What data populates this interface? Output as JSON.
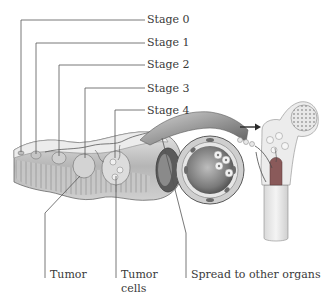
{
  "diagram": {
    "stages": [
      {
        "label": "Stage 0",
        "y": 19
      },
      {
        "label": "Stage 1",
        "y": 42
      },
      {
        "label": "Stage 2",
        "y": 64
      },
      {
        "label": "Stage 3",
        "y": 88
      },
      {
        "label": "Stage 4",
        "y": 110
      }
    ],
    "bottom_labels": {
      "tumor": "Tumor",
      "tumor_cells_line1": "Tumor",
      "tumor_cells_line2": "cells",
      "spread": "Spread to other organs"
    },
    "illustrations": [
      "colon-wall-cross-section",
      "blood-vessel-with-tumor-cells",
      "femur-bone-metastasis"
    ],
    "colors": {
      "line": "#555555",
      "text": "#3a3a3a",
      "tissue_light": "#d8d8d8",
      "tissue_mid": "#a8a8a8",
      "tissue_dark": "#6a6a6a",
      "bone_marrow": "#8a5a5a"
    }
  }
}
